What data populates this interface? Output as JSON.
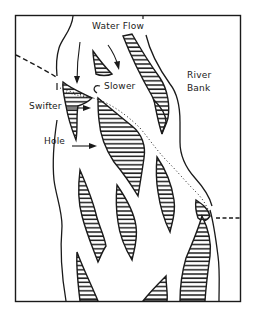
{
  "diagram": {
    "labels": {
      "water_flow": "Water Flow",
      "slower": "Slower",
      "river_bank_line1": "River",
      "river_bank_line2": "Bank",
      "swifter": "Swifter",
      "hole": "Hole"
    },
    "colors": {
      "ink": "#1a1a1a",
      "background": "#ffffff"
    },
    "legend": {
      "hatched": "sand bars / islands",
      "dashed_line": "path across river",
      "dotted_line": "current seam"
    }
  }
}
